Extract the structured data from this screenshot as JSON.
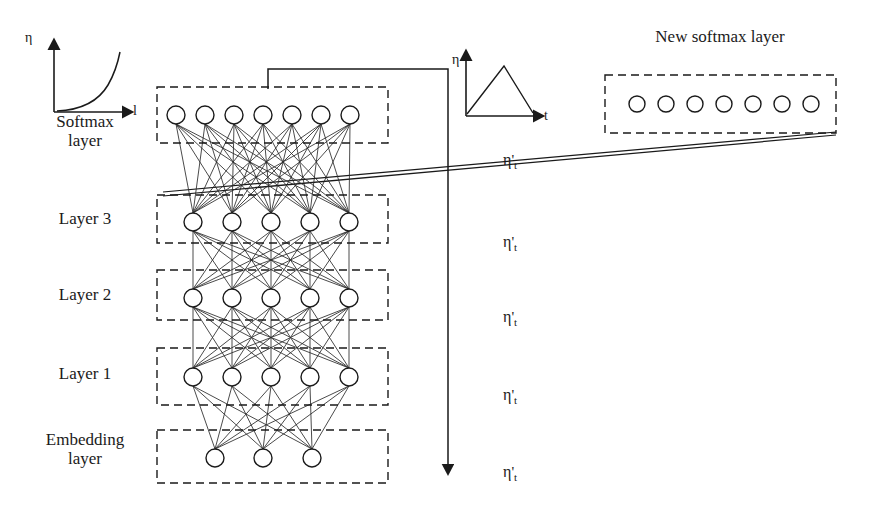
{
  "figure": {
    "type": "neural-network-architecture-diagram",
    "background": "#ffffff",
    "stroke_color": "#1a1a1a",
    "width": 874,
    "height": 513
  },
  "titles": {
    "new_softmax_layer": "New softmax layer"
  },
  "left_labels": [
    {
      "id": "softmax-layer",
      "text": "Softmax\nlayer"
    },
    {
      "id": "layer-3",
      "text": "Layer 3"
    },
    {
      "id": "layer-2",
      "text": "Layer 2"
    },
    {
      "id": "layer-1",
      "text": "Layer 1"
    },
    {
      "id": "embedding-layer",
      "text": "Embedding\nlayer"
    }
  ],
  "mini_charts": [
    {
      "id": "left-lr-chart",
      "ylabel": "η",
      "xlabel": "l",
      "shape": "exponential-increasing-curve",
      "description": "Learning rate eta grows exponentially with layer index l"
    },
    {
      "id": "right-lr-chart",
      "ylabel": "η",
      "xlabel": "t",
      "shape": "triangular-warmup-decay",
      "description": "Learning rate eta rises then linearly decays over time t"
    }
  ],
  "eta_labels": [
    {
      "id": "eta-softmax",
      "base": "η",
      "prime": "'",
      "sub": "t"
    },
    {
      "id": "eta-layer3",
      "base": "η",
      "prime": "'",
      "sub": "t"
    },
    {
      "id": "eta-layer2",
      "base": "η",
      "prime": "'",
      "sub": "t"
    },
    {
      "id": "eta-layer1",
      "base": "η",
      "prime": "'",
      "sub": "t"
    },
    {
      "id": "eta-embedding",
      "base": "η",
      "prime": "'",
      "sub": "t"
    }
  ],
  "network": {
    "box_left": 157,
    "box_right": 388,
    "layers": [
      {
        "id": "softmax-layer",
        "units": 7,
        "box_top": 87,
        "box_bottom": 143,
        "node_y": 115,
        "node_r": 9,
        "node_x": [
          176,
          205,
          234,
          263,
          292,
          321,
          350
        ]
      },
      {
        "id": "layer-3",
        "units": 5,
        "box_top": 195,
        "box_bottom": 243,
        "node_y": 222,
        "node_r": 9,
        "node_x": [
          193,
          232,
          271,
          310,
          349
        ]
      },
      {
        "id": "layer-2",
        "units": 5,
        "box_top": 270,
        "box_bottom": 320,
        "node_y": 298,
        "node_r": 9,
        "node_x": [
          193,
          232,
          271,
          310,
          349
        ]
      },
      {
        "id": "layer-1",
        "units": 5,
        "box_top": 348,
        "box_bottom": 405,
        "node_y": 377,
        "node_r": 9,
        "node_x": [
          193,
          232,
          271,
          310,
          349
        ]
      },
      {
        "id": "embedding-layer",
        "units": 3,
        "box_top": 430,
        "box_bottom": 483,
        "node_y": 458,
        "node_r": 9,
        "node_x": [
          215,
          263,
          312
        ]
      }
    ],
    "connections": [
      {
        "from": "layer-3",
        "to": "softmax-layer",
        "style": "fully-connected"
      },
      {
        "from": "layer-2",
        "to": "layer-3",
        "style": "fully-connected"
      },
      {
        "from": "layer-1",
        "to": "layer-2",
        "style": "fully-connected"
      },
      {
        "from": "embedding-layer",
        "to": "layer-1",
        "style": "fully-connected"
      }
    ]
  },
  "new_softmax": {
    "box": {
      "x": 605,
      "y": 75,
      "w": 231,
      "h": 58
    },
    "units": 7,
    "node_y": 104,
    "node_r": 8,
    "node_x": [
      637,
      666,
      695,
      724,
      753,
      782,
      811
    ]
  },
  "arrows": {
    "time_axis": {
      "id": "training-time-arrow",
      "description": "vertical downward arrow alongside layer stack",
      "path": "from softmax box top up, right, then straight down with arrowhead",
      "x": 448,
      "y_top": 69,
      "y_bottom": 477
    },
    "replacement_lines": [
      {
        "id": "replacement-line-top",
        "from": [
          163,
          193
        ],
        "to": [
          836,
          133
        ]
      },
      {
        "id": "replacement-line-bottom",
        "from": [
          163,
          196
        ],
        "to": [
          836,
          134
        ]
      }
    ]
  }
}
